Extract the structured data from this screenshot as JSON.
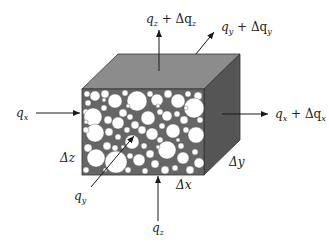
{
  "figure": {
    "colors": {
      "top_face": "#8a8a8a",
      "right_face": "#555555",
      "front_matrix": "#6a6a6a",
      "pores": "#ffffff",
      "arrows": "#1a1a1a"
    },
    "labels": {
      "qx_in": {
        "base": "q",
        "sub": "x"
      },
      "qx_out": {
        "base": "q",
        "sub": "x",
        "plus": " + Δq",
        "sub2": "x"
      },
      "qz_in": {
        "base": "q",
        "sub": "z"
      },
      "qz_out": {
        "base": "q",
        "sub": "z",
        "plus": " + Δq",
        "sub2": "z"
      },
      "qy_in": {
        "base": "q",
        "sub": "y"
      },
      "qy_out": {
        "base": "q",
        "sub": "y",
        "plus": " + Δq",
        "sub2": "y"
      },
      "dz": "Δz",
      "dy": "Δy",
      "dx": "Δx"
    }
  }
}
